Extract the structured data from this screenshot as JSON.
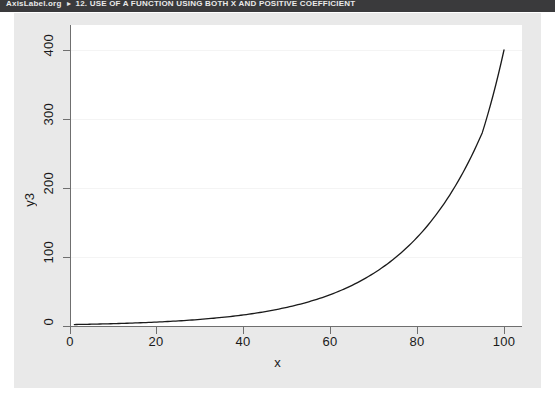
{
  "header": {
    "brand": "AxisLabel.org",
    "separator_icon": "caret-right-icon",
    "breadcrumb": "12. USE OF A FUNCTION USING BOTH X AND POSITIVE COEFFICIENT"
  },
  "figure": {
    "background_color": "#e9e9e9",
    "panel_color": "#ffffff",
    "line_color": "#1a1a1a"
  },
  "chart_data": {
    "type": "line",
    "title": "",
    "xlabel": "x",
    "ylabel": "y3",
    "xlim": [
      0,
      103
    ],
    "ylim": [
      0,
      420
    ],
    "xticks": [
      0,
      20,
      40,
      60,
      80,
      100
    ],
    "xtick_labels": [
      "0",
      "20",
      "40",
      "60",
      "80",
      "100"
    ],
    "yticks": [
      0,
      100,
      200,
      300,
      400
    ],
    "ytick_labels": [
      "0",
      "100",
      "200",
      "300",
      "400"
    ],
    "grid": true,
    "grid_axis": "y",
    "legend": false,
    "series": [
      {
        "name": "y3",
        "x": [
          1,
          5,
          10,
          15,
          20,
          25,
          30,
          35,
          40,
          45,
          50,
          55,
          60,
          65,
          70,
          75,
          80,
          85,
          90,
          95,
          100
        ],
        "values": [
          2.1,
          2.6,
          3.4,
          4.4,
          5.7,
          7.4,
          9.6,
          12.4,
          16.1,
          20.9,
          27.1,
          35.1,
          45.5,
          59.0,
          76.5,
          99.2,
          128.6,
          166.7,
          216.1,
          280.2,
          400.0
        ]
      }
    ]
  }
}
